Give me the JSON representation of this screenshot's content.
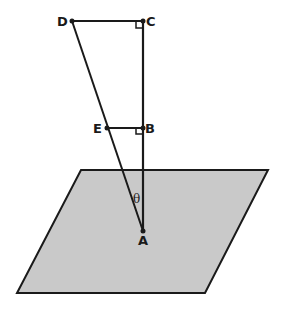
{
  "diagram": {
    "plane": {
      "corners": [
        [
          81,
          170
        ],
        [
          268,
          170
        ],
        [
          205,
          293
        ],
        [
          17,
          293
        ]
      ],
      "fill": "#c9c9c9",
      "stroke": "#1a1a1a"
    },
    "points": {
      "A": {
        "label": "A",
        "x": 143,
        "y": 231
      },
      "B": {
        "label": "B",
        "x": 143,
        "y": 128
      },
      "C": {
        "label": "C",
        "x": 143,
        "y": 21
      },
      "D": {
        "label": "D",
        "x": 72,
        "y": 21
      },
      "E": {
        "label": "E",
        "x": 107,
        "y": 128
      }
    },
    "angle_label": "θ",
    "segments": [
      "AC",
      "DC",
      "EB",
      "DA"
    ],
    "right_angles": [
      "C",
      "B"
    ]
  }
}
